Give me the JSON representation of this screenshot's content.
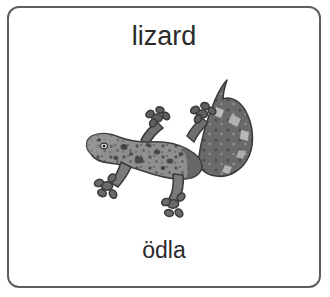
{
  "card": {
    "title": "lizard",
    "translation": "ödla",
    "illustration_name": "lizard-gecko-illustration",
    "border_color": "#5e5e5e",
    "background_color": "#ffffff",
    "text_color": "#2b2b2b",
    "illustration_colors": {
      "body_light": "#9a9a9a",
      "body_mid": "#848484",
      "body_dark": "#5a5a5a",
      "outline": "#3c3c3c",
      "speckle": "#3a3a3a"
    }
  }
}
